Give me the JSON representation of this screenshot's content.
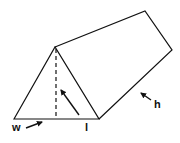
{
  "diagram": {
    "type": "triangular-prism",
    "labels": {
      "width": "w",
      "length": "l",
      "height": "h"
    },
    "colors": {
      "stroke": "#111111",
      "background": "#ffffff"
    }
  }
}
